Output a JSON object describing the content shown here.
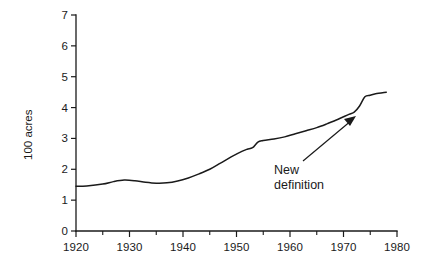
{
  "chart_data": {
    "type": "line",
    "title": "",
    "xlabel": "",
    "ylabel": "100 acres",
    "xlim": [
      1920,
      1980
    ],
    "ylim": [
      0,
      7
    ],
    "grid": false,
    "legend": "none",
    "x_ticks": [
      1920,
      1930,
      1940,
      1950,
      1960,
      1970,
      1980
    ],
    "x_tick_labels": [
      "1920",
      "1930",
      "1940",
      "1950",
      "1960",
      "1970",
      "1980"
    ],
    "x_minor_ticks": [
      1925,
      1935,
      1945,
      1955,
      1965,
      1975
    ],
    "y_ticks": [
      0,
      1,
      2,
      3,
      4,
      5,
      6,
      7
    ],
    "y_tick_labels": [
      "0",
      "1",
      "2",
      "3",
      "4",
      "5",
      "6",
      "7"
    ],
    "series": [
      {
        "name": "Average farm size",
        "color": "#1a1a1a",
        "x": [
          1920,
          1922,
          1925,
          1927,
          1929,
          1931,
          1933,
          1935,
          1937,
          1939,
          1941,
          1943,
          1945,
          1947,
          1949,
          1951,
          1952,
          1953,
          1954,
          1955,
          1957,
          1959,
          1961,
          1963,
          1965,
          1967,
          1969,
          1971,
          1972,
          1973,
          1974,
          1975,
          1976,
          1978
        ],
        "values": [
          1.45,
          1.46,
          1.52,
          1.6,
          1.65,
          1.63,
          1.58,
          1.55,
          1.56,
          1.62,
          1.72,
          1.85,
          2.0,
          2.2,
          2.4,
          2.58,
          2.65,
          2.7,
          2.88,
          2.93,
          2.98,
          3.05,
          3.15,
          3.25,
          3.35,
          3.48,
          3.62,
          3.78,
          3.85,
          4.05,
          4.35,
          4.4,
          4.45,
          4.5
        ]
      }
    ],
    "annotations": [
      {
        "name": "new-definition",
        "line1": "New",
        "line2": "definition",
        "points_to_year": 1974,
        "points_to_value": 4.1
      }
    ]
  },
  "colors": {
    "ink": "#1a1a1a",
    "background": "#ffffff"
  }
}
